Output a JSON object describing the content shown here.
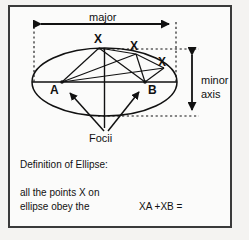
{
  "figure": {
    "kind": "ellipse-definition-diagram",
    "border_color": "#3a3a3a",
    "background_color": "#fbfbfa",
    "ink_color": "#111111",
    "labels": {
      "major": "major",
      "minor_line1": "minor",
      "minor_line2": "axis",
      "point_x1": "X",
      "point_x2": "X",
      "point_x3": "X",
      "focus_a": "A",
      "focus_b": "B",
      "focii": "Focii",
      "definition_heading": "Definition of Ellipse:",
      "definition_line1": "all the points X on",
      "definition_line2": "ellipse obey the",
      "equation": "XA +XB ="
    },
    "geometry": {
      "ellipse_center_x": 104.5,
      "ellipse_center_y": 82,
      "ellipse_rx": 72.5,
      "ellipse_ry": 34,
      "focus_a_x": 62,
      "focus_a_y": 82,
      "focus_b_x": 145,
      "focus_b_y": 82,
      "point_x1_x": 99,
      "point_x1_y": 48,
      "point_x2_x": 136,
      "point_x2_y": 54,
      "point_x3_x": 164,
      "point_x3_y": 68,
      "major_arrow_y": 24,
      "major_arrow_x1": 34,
      "major_arrow_x2": 176,
      "minor_arrow_x": 192,
      "minor_arrow_y1": 48,
      "minor_arrow_y2": 116
    }
  }
}
